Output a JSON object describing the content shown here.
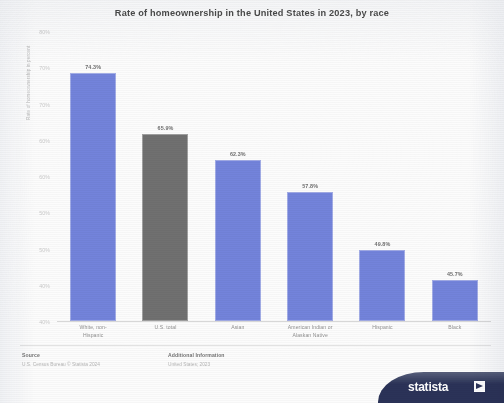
{
  "title": "Rate of homeownership in the United States in 2023, by race",
  "colors": {
    "bar": "#6e7fdb",
    "highlight_bar": "#6b6b6b",
    "brand": "#232c52"
  },
  "axis": {
    "ylabel": "Rate of homeownership in percent"
  },
  "footer": {
    "source_heading": "Source",
    "source_lines": "U.S. Census Bureau\n© Statista 2024",
    "additional_heading": "Additional Information",
    "additional_lines": "United States; 2023"
  },
  "brand": {
    "wordmark": "statista",
    "mark": "statista-logo-mark"
  },
  "chart_data": {
    "type": "bar",
    "title": "Rate of homeownership in the United States in 2023, by race",
    "xlabel": "",
    "ylabel": "Rate of homeownership in percent",
    "ylim": [
      40,
      80
    ],
    "yticks": [
      "80%",
      "70%",
      "70%",
      "60%",
      "60%",
      "50%",
      "50%",
      "40%",
      "40%"
    ],
    "ytick_values": [
      80,
      75,
      70,
      65,
      60,
      55,
      50,
      45,
      40
    ],
    "grid": false,
    "legend": "none",
    "categories": [
      "White, non-Hispanic",
      "U.S. total",
      "Asian",
      "American Indian or Alaskan Native",
      "Hispanic",
      "Black"
    ],
    "category_lines": [
      [
        "White, non-",
        "Hispanic"
      ],
      [
        "U.S. total",
        ""
      ],
      [
        "Asian",
        ""
      ],
      [
        "American Indian or",
        "Alaskan Native"
      ],
      [
        "Hispanic",
        ""
      ],
      [
        "Black",
        ""
      ]
    ],
    "values": [
      74.3,
      65.9,
      62.3,
      57.8,
      49.8,
      45.7
    ],
    "data_labels": [
      "74.3%",
      "65.9%",
      "62.3%",
      "57.8%",
      "49.8%",
      "45.7%"
    ],
    "highlight_index": 1
  }
}
